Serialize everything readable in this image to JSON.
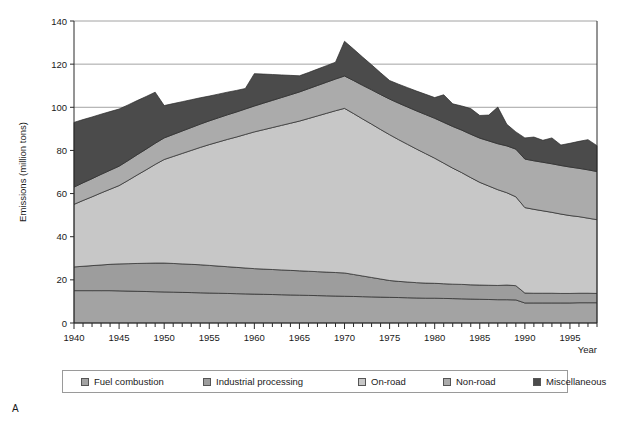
{
  "panel": {
    "letter": "A"
  },
  "chart_data": {
    "type": "area",
    "stacked": true,
    "title": "",
    "xlabel": "Year",
    "ylabel": "Emissions (million tons)",
    "xlim": [
      1940,
      1998
    ],
    "ylim": [
      0,
      140
    ],
    "ytick_step": 20,
    "yticks": [
      0,
      20,
      40,
      60,
      80,
      100,
      120,
      140
    ],
    "xticks_labeled": [
      1940,
      1945,
      1950,
      1955,
      1960,
      1965,
      1970,
      1975,
      1980,
      1985,
      1990,
      1995
    ],
    "xtick_minor_step": 1,
    "grid": "horizontal",
    "legend_position": "bottom",
    "x": [
      1940,
      1941,
      1942,
      1943,
      1944,
      1945,
      1946,
      1947,
      1948,
      1949,
      1950,
      1951,
      1952,
      1953,
      1954,
      1955,
      1956,
      1957,
      1958,
      1959,
      1960,
      1961,
      1962,
      1963,
      1964,
      1965,
      1966,
      1967,
      1968,
      1969,
      1970,
      1971,
      1972,
      1973,
      1974,
      1975,
      1976,
      1977,
      1978,
      1979,
      1980,
      1981,
      1982,
      1983,
      1984,
      1985,
      1986,
      1987,
      1988,
      1989,
      1990,
      1991,
      1992,
      1993,
      1994,
      1995,
      1996,
      1997,
      1998
    ],
    "series": [
      {
        "name": "Fuel combustion",
        "color": "#a3a3a3",
        "values": [
          15.0,
          15.0,
          15.0,
          15.0,
          15.0,
          14.9,
          14.8,
          14.7,
          14.6,
          14.5,
          14.4,
          14.3,
          14.2,
          14.1,
          14.0,
          13.9,
          13.8,
          13.7,
          13.6,
          13.5,
          13.4,
          13.3,
          13.2,
          13.1,
          13.0,
          12.9,
          12.8,
          12.7,
          12.6,
          12.5,
          12.4,
          12.3,
          12.2,
          12.1,
          12.0,
          11.9,
          11.8,
          11.7,
          11.6,
          11.5,
          11.5,
          11.4,
          11.3,
          11.2,
          11.1,
          11.0,
          10.9,
          10.8,
          10.8,
          10.7,
          9.3,
          9.3,
          9.3,
          9.3,
          9.3,
          9.3,
          9.4,
          9.4,
          9.4
        ]
      },
      {
        "name": "Industrial processing",
        "color": "#9d9d9d",
        "values": [
          11.0,
          11.3,
          11.6,
          11.9,
          12.2,
          12.5,
          12.7,
          12.9,
          13.1,
          13.3,
          13.4,
          13.3,
          13.2,
          13.1,
          13.0,
          12.8,
          12.6,
          12.4,
          12.2,
          12.0,
          11.8,
          11.7,
          11.6,
          11.5,
          11.4,
          11.3,
          11.2,
          11.1,
          11.0,
          10.9,
          10.8,
          10.2,
          9.6,
          9.0,
          8.4,
          7.8,
          7.5,
          7.3,
          7.1,
          7.0,
          6.9,
          6.8,
          6.7,
          6.7,
          6.6,
          6.6,
          6.6,
          6.6,
          6.8,
          6.6,
          4.6,
          4.5,
          4.5,
          4.5,
          4.4,
          4.4,
          4.4,
          4.4,
          4.3
        ]
      },
      {
        "name": "On-road",
        "color": "#c7c7c7",
        "values": [
          29.0,
          30.5,
          31.9,
          33.4,
          34.8,
          36.3,
          38.6,
          41.0,
          43.3,
          45.7,
          48.0,
          49.6,
          51.2,
          52.8,
          54.4,
          56.0,
          57.5,
          59.0,
          60.4,
          61.9,
          63.4,
          64.6,
          65.8,
          67.0,
          68.2,
          69.4,
          70.8,
          72.2,
          73.6,
          75.0,
          76.3,
          74.6,
          72.8,
          71.1,
          69.3,
          67.6,
          65.7,
          63.8,
          61.9,
          60.0,
          58.0,
          55.9,
          53.8,
          51.8,
          49.7,
          47.6,
          46.0,
          44.4,
          42.8,
          41.2,
          39.6,
          38.9,
          38.2,
          37.5,
          36.8,
          36.1,
          35.5,
          34.8,
          34.2
        ]
      },
      {
        "name": "Non-road",
        "color": "#ababab",
        "values": [
          8.0,
          8.2,
          8.4,
          8.6,
          8.8,
          9.0,
          9.2,
          9.4,
          9.6,
          9.8,
          10.0,
          10.2,
          10.4,
          10.6,
          10.8,
          11.0,
          11.2,
          11.4,
          11.6,
          11.8,
          12.0,
          12.3,
          12.6,
          12.9,
          13.2,
          13.5,
          13.8,
          14.1,
          14.4,
          14.7,
          15.0,
          15.3,
          15.6,
          15.9,
          16.2,
          16.5,
          16.9,
          17.3,
          17.7,
          18.1,
          18.5,
          18.9,
          19.3,
          19.7,
          20.1,
          20.5,
          20.9,
          21.3,
          21.7,
          22.1,
          22.5,
          22.5,
          22.5,
          22.5,
          22.5,
          22.5,
          22.4,
          22.4,
          22.3
        ]
      },
      {
        "name": "Miscellaneous",
        "color": "#4b4b4b",
        "values": [
          30.0,
          29.3,
          28.6,
          27.9,
          27.2,
          26.5,
          25.8,
          25.1,
          24.4,
          23.7,
          15.0,
          14.3,
          13.6,
          12.9,
          12.2,
          11.5,
          11.0,
          10.5,
          10.0,
          9.5,
          15.0,
          13.5,
          12.0,
          10.5,
          9.0,
          7.5,
          7.5,
          7.6,
          7.7,
          7.8,
          16.1,
          14.6,
          13.1,
          11.6,
          10.1,
          8.6,
          8.8,
          9.0,
          9.2,
          9.4,
          9.6,
          12.8,
          10.5,
          11.2,
          11.9,
          10.5,
          12.0,
          17.0,
          10.0,
          8.0,
          9.8,
          11.0,
          10.2,
          12.0,
          9.5,
          11.0,
          12.5,
          14.0,
          12.0
        ]
      }
    ]
  },
  "legend": {
    "items": [
      {
        "label": "Fuel combustion",
        "color": "#a3a3a3"
      },
      {
        "label": "Industrial processing",
        "color": "#9d9d9d"
      },
      {
        "label": "On-road",
        "color": "#c7c7c7"
      },
      {
        "label": "Non-road",
        "color": "#ababab"
      },
      {
        "label": "Miscellaneous",
        "color": "#4b4b4b"
      }
    ]
  }
}
